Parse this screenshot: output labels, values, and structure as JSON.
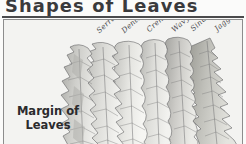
{
  "poster": {
    "title": "Shapes of Leaves",
    "caption_line1": "Margin of",
    "caption_line2": "Leaves",
    "title_color": "#3a3a3c",
    "caption_color": "#2b2b2d",
    "background_color": "#f3f3f1",
    "border_color": "#8d8d8d",
    "rule_color": "#4a4a4c"
  },
  "labels": [
    {
      "text": "Serrate",
      "left": 97,
      "top": 27,
      "rotate": -42
    },
    {
      "text": "Dentate",
      "left": 122,
      "top": 27,
      "rotate": -42
    },
    {
      "text": "Crenate",
      "left": 147,
      "top": 26,
      "rotate": -42
    },
    {
      "text": "Wavy",
      "left": 172,
      "top": 26,
      "rotate": -42
    },
    {
      "text": "Sinuate",
      "left": 191,
      "top": 25,
      "rotate": -42
    },
    {
      "text": "Jagged",
      "left": 215,
      "top": 25,
      "rotate": -42
    }
  ],
  "illustration": {
    "description": "fan of six overlapping leaves each showing a different margin type",
    "ink_color": "#5a5a5c",
    "shade_light": "#e2e2de",
    "shade_mid": "#c4c4c0",
    "shade_dark": "#9a9a96"
  }
}
